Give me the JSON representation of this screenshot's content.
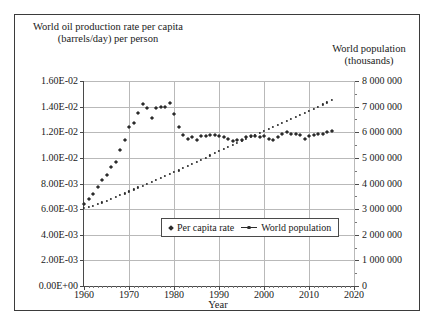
{
  "chart_data": {
    "type": "scatter",
    "title": "",
    "xlabel": "Year",
    "ylabel_left": "World oil production rate per capita (barrels/day) per person",
    "ylabel_right": "World population (thousands)",
    "grid": true,
    "legend_position": "inside-bottom-center",
    "xlim": [
      1960,
      2020
    ],
    "xticks": [
      "1960",
      "1970",
      "1980",
      "1990",
      "2000",
      "2010",
      "2020"
    ],
    "xtick_values": [
      1960,
      1970,
      1980,
      1990,
      2000,
      2010,
      2020
    ],
    "ylim_left": [
      0,
      0.016
    ],
    "yticks_left": [
      "0.00E+00",
      "2.00E-03",
      "4.00E-03",
      "6.00E-03",
      "8.00E-03",
      "1.00E-02",
      "1.20E-02",
      "1.40E-02",
      "1.60E-02"
    ],
    "ytick_values_left": [
      0,
      0.002,
      0.004,
      0.006,
      0.008,
      0.01,
      0.012,
      0.014,
      0.016
    ],
    "ylim_right": [
      0,
      8000000
    ],
    "yticks_right": [
      "0",
      "1 000 000",
      "2 000 000",
      "3 000 000",
      "4 000 000",
      "5 000 000",
      "6 000 000",
      "7 000 000",
      "8 000 000"
    ],
    "ytick_values_right": [
      0,
      1000000,
      2000000,
      3000000,
      4000000,
      5000000,
      6000000,
      7000000,
      8000000
    ],
    "series": [
      {
        "name": "Per capita rate",
        "axis": "left",
        "marker": "diamond",
        "x": [
          1960,
          1961,
          1962,
          1963,
          1964,
          1965,
          1966,
          1967,
          1968,
          1969,
          1970,
          1971,
          1972,
          1973,
          1974,
          1975,
          1976,
          1977,
          1978,
          1979,
          1980,
          1981,
          1982,
          1983,
          1984,
          1985,
          1986,
          1987,
          1988,
          1989,
          1990,
          1991,
          1992,
          1993,
          1994,
          1995,
          1996,
          1997,
          1998,
          1999,
          2000,
          2001,
          2002,
          2003,
          2004,
          2005,
          2006,
          2007,
          2008,
          2009,
          2010,
          2011,
          2012,
          2013,
          2014,
          2015
        ],
        "y": [
          0.0064,
          0.0068,
          0.0072,
          0.0077,
          0.0083,
          0.0087,
          0.0093,
          0.0097,
          0.0106,
          0.0114,
          0.0124,
          0.0127,
          0.0135,
          0.0142,
          0.0139,
          0.0131,
          0.0139,
          0.014,
          0.014,
          0.0143,
          0.0134,
          0.0124,
          0.0118,
          0.0115,
          0.0116,
          0.0114,
          0.0117,
          0.0117,
          0.0118,
          0.0118,
          0.0117,
          0.0116,
          0.0115,
          0.0113,
          0.0114,
          0.0114,
          0.0116,
          0.0117,
          0.0117,
          0.0116,
          0.0117,
          0.0115,
          0.0114,
          0.0116,
          0.0119,
          0.012,
          0.0119,
          0.0119,
          0.0118,
          0.0115,
          0.0117,
          0.0118,
          0.0119,
          0.0119,
          0.012,
          0.0121
        ]
      },
      {
        "name": "World population",
        "axis": "right",
        "marker": "dot-line",
        "x": [
          1960,
          1961,
          1962,
          1963,
          1964,
          1965,
          1966,
          1967,
          1968,
          1969,
          1970,
          1971,
          1972,
          1973,
          1974,
          1975,
          1976,
          1977,
          1978,
          1979,
          1980,
          1981,
          1982,
          1983,
          1984,
          1985,
          1986,
          1987,
          1988,
          1989,
          1990,
          1991,
          1992,
          1993,
          1994,
          1995,
          1996,
          1997,
          1998,
          1999,
          2000,
          2001,
          2002,
          2003,
          2004,
          2005,
          2006,
          2007,
          2008,
          2009,
          2010,
          2011,
          2012,
          2013,
          2014,
          2015
        ],
        "y": [
          3033000,
          3072000,
          3126000,
          3193000,
          3260000,
          3328000,
          3398000,
          3469000,
          3541000,
          3615000,
          3691000,
          3768000,
          3845000,
          3921000,
          3997000,
          4071000,
          4143000,
          4215000,
          4287000,
          4361000,
          4437000,
          4514000,
          4595000,
          4677000,
          4757000,
          4838000,
          4922000,
          5007000,
          5093000,
          5179000,
          5264000,
          5348000,
          5430000,
          5511000,
          5592000,
          5672000,
          5752000,
          5831000,
          5909000,
          5986000,
          6062000,
          6138000,
          6213000,
          6289000,
          6365000,
          6442000,
          6520000,
          6599000,
          6679000,
          6759000,
          6840000,
          6922000,
          7004000,
          7086000,
          7167000,
          7248000
        ]
      }
    ]
  },
  "legend": {
    "items": [
      {
        "label": "Per capita rate"
      },
      {
        "label": "World population"
      }
    ]
  }
}
